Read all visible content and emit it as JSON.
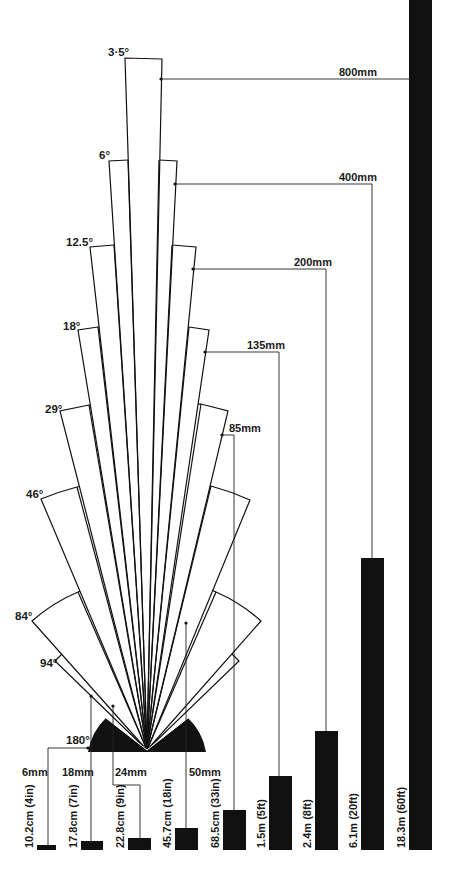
{
  "diagram": {
    "colors": {
      "ink": "#111111",
      "background": "#ffffff"
    },
    "origin": {
      "x": 147,
      "y": 750
    },
    "lenses": [
      {
        "focal": "6mm",
        "angle": "180°",
        "angle_deg": 180,
        "radius": 58,
        "distance": "10.2cm (4in)"
      },
      {
        "focal": "18mm",
        "angle": "94°",
        "angle_deg": 94,
        "radius": 130,
        "distance": "17.8cm (7in)"
      },
      {
        "focal": "24mm",
        "angle": "84°",
        "angle_deg": 84,
        "radius": 163,
        "distance": "22.8cm (9in)"
      },
      {
        "focal": "50mm",
        "angle": "46°",
        "angle_deg": 46,
        "radius": 270,
        "distance": "45.7cm (18in)"
      },
      {
        "focal": "85mm",
        "angle": "29°",
        "angle_deg": 29,
        "radius": 343,
        "distance": "68.5cm (33in)"
      },
      {
        "focal": "135mm",
        "angle": "18°",
        "angle_deg": 18,
        "radius": 405,
        "distance": "1.5m (5ft)"
      },
      {
        "focal": "200mm",
        "angle": "12.5°",
        "angle_deg": 12.5,
        "radius": 500,
        "distance": "2.4m (8ft)"
      },
      {
        "focal": "400mm",
        "angle": "6°",
        "angle_deg": 6,
        "radius": 600,
        "distance": "6.1m (20ft)"
      },
      {
        "focal": "800mm",
        "angle": "3·5°",
        "angle_deg": 3.5,
        "radius": 722,
        "distance": "18.3m (60ft)"
      }
    ],
    "labels": {
      "angle_3_5": "3·5°",
      "angle_6": "6°",
      "angle_12_5": "12.5°",
      "angle_18": "18°",
      "angle_29": "29°",
      "angle_46": "46°",
      "angle_84": "84°",
      "angle_94": "94°",
      "angle_180": "180°",
      "focal_800": "800mm",
      "focal_400": "400mm",
      "focal_200": "200mm",
      "focal_135": "135mm",
      "focal_85": "85mm",
      "focal_6": "6mm",
      "focal_18": "18mm",
      "focal_24": "24mm",
      "focal_50": "50mm",
      "dist_6": "10.2cm (4in)",
      "dist_18": "17.8cm (7in)",
      "dist_24": "22.8cm (9in)",
      "dist_50": "45.7cm (18in)",
      "dist_85": "68.5cm (33in)",
      "dist_135": "1.5m (5ft)",
      "dist_200": "2.4m (8ft)",
      "dist_400": "6.1m (20ft)",
      "dist_800": "18.3m (60ft)"
    },
    "bars": [
      {
        "focal": "6mm",
        "x": 37,
        "width": 19,
        "top": 845,
        "bottom": 850
      },
      {
        "focal": "18mm",
        "x": 81,
        "width": 22,
        "top": 841,
        "bottom": 850
      },
      {
        "focal": "24mm",
        "x": 128,
        "width": 23,
        "top": 838,
        "bottom": 850
      },
      {
        "focal": "50mm",
        "x": 175,
        "width": 23,
        "top": 828,
        "bottom": 850
      },
      {
        "focal": "85mm",
        "x": 223,
        "width": 23,
        "top": 810,
        "bottom": 850
      },
      {
        "focal": "135mm",
        "x": 269,
        "width": 23,
        "top": 776,
        "bottom": 850
      },
      {
        "focal": "200mm",
        "x": 315,
        "width": 23,
        "top": 731,
        "bottom": 850
      },
      {
        "focal": "400mm",
        "x": 361,
        "width": 23,
        "top": 558,
        "bottom": 850
      },
      {
        "focal": "800mm",
        "x": 409,
        "width": 23,
        "top": 0,
        "bottom": 850
      }
    ]
  }
}
